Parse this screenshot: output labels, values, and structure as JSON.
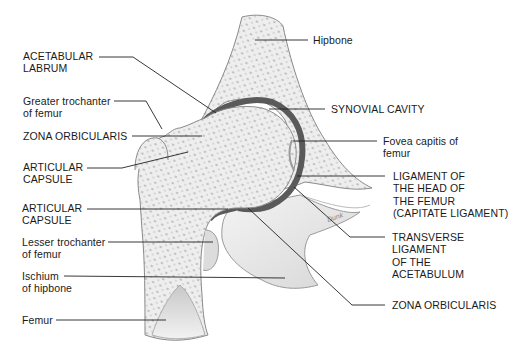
{
  "diagram": {
    "labels_left": [
      {
        "id": "acetabular-labrum",
        "text": "ACETABULAR\nLABRUM",
        "x": 23,
        "y": 50
      },
      {
        "id": "greater-trochanter",
        "text": "Greater trochanter\nof femur",
        "x": 23,
        "y": 95
      },
      {
        "id": "zona-orbicularis-left",
        "text": "ZONA ORBICULARIS",
        "x": 23,
        "y": 130
      },
      {
        "id": "articular-capsule-upper",
        "text": "ARTICULAR\nCAPSULE",
        "x": 23,
        "y": 161
      },
      {
        "id": "articular-capsule-lower",
        "text": "ARTICULAR\nCAPSULE",
        "x": 22,
        "y": 201
      },
      {
        "id": "lesser-trochanter",
        "text": "Lesser trochanter\nof femur",
        "x": 22,
        "y": 236
      },
      {
        "id": "ischium",
        "text": "Ischium\nof hipbone",
        "x": 22,
        "y": 270
      },
      {
        "id": "femur",
        "text": "Femur",
        "x": 22,
        "y": 314
      }
    ],
    "labels_right": [
      {
        "id": "hipbone",
        "text": "Hipbone",
        "x": 314,
        "y": 35
      },
      {
        "id": "synovial-cavity",
        "text": "SYNOVIAL CAVITY",
        "x": 332,
        "y": 104
      },
      {
        "id": "fovea-capitis",
        "text": "Fovea capitis of\nfemur",
        "x": 383,
        "y": 137
      },
      {
        "id": "ligament-head-femur",
        "text": "LIGAMENT OF\nTHE HEAD OF\nTHE FEMUR\n(CAPITATE LIGAMENT)",
        "x": 393,
        "y": 171
      },
      {
        "id": "transverse-ligament",
        "text": "TRANSVERSE\nLIGAMENT\nOF THE\nACETABULUM",
        "x": 392,
        "y": 233
      },
      {
        "id": "zona-orbicularis-right",
        "text": "ZONA ORBICULARIS",
        "x": 392,
        "y": 300
      }
    ],
    "signature": "Dunk",
    "colors": {
      "bone_fill": "#ececec",
      "bone_stroke": "#8a8a8a",
      "cavity": "#5a5a5a",
      "leader": "#222222",
      "text": "#1a1a1a"
    }
  }
}
